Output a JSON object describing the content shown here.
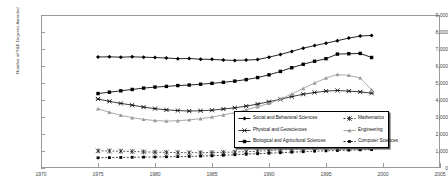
{
  "chart_data": {
    "type": "line",
    "title": "",
    "xlabel": "",
    "ylabel": "Number of S&E Degrees Awarded",
    "xlim": [
      1970,
      2005
    ],
    "ylim": [
      0,
      9000
    ],
    "xticks": [
      1970,
      1975,
      1980,
      1985,
      1990,
      1995,
      2000,
      2005
    ],
    "xtick_labels": [
      "1970",
      "1975",
      "1980",
      "1985",
      "1990",
      "1995",
      "2000",
      "2005"
    ],
    "yticks": [
      0,
      1000,
      2000,
      3000,
      4000,
      5000,
      6000,
      7000,
      8000,
      9000
    ],
    "ytick_labels": [
      "0",
      "1,000",
      "2,000",
      "3,000",
      "4,000",
      "5,000",
      "6,000",
      "7,000",
      "8,000",
      "9,000"
    ],
    "grid": false,
    "legend_position": "inside-lower-right",
    "x": [
      1975,
      1976,
      1977,
      1978,
      1979,
      1980,
      1981,
      1982,
      1983,
      1984,
      1985,
      1986,
      1987,
      1988,
      1989,
      1990,
      1991,
      1992,
      1993,
      1994,
      1995,
      1996,
      1997,
      1998,
      1999
    ],
    "series": [
      {
        "name": "Social and Behavioral Sciences",
        "marker": "diamond",
        "color": "#000000",
        "values": [
          6530,
          6540,
          6520,
          6540,
          6520,
          6500,
          6470,
          6430,
          6440,
          6400,
          6390,
          6350,
          6330,
          6350,
          6380,
          6520,
          6680,
          6860,
          7050,
          7200,
          7340,
          7490,
          7640,
          7760,
          7800
        ]
      },
      {
        "name": "Physical and Geosciences",
        "marker": "cross-x",
        "color": "#1a1a1a",
        "values": [
          4060,
          3920,
          3800,
          3700,
          3580,
          3490,
          3420,
          3380,
          3350,
          3370,
          3400,
          3470,
          3540,
          3640,
          3760,
          3900,
          4040,
          4200,
          4340,
          4440,
          4520,
          4560,
          4520,
          4480,
          4400
        ]
      },
      {
        "name": "Biological and Agricultural Sciences",
        "marker": "square",
        "color": "#000000",
        "values": [
          4380,
          4460,
          4540,
          4620,
          4700,
          4760,
          4800,
          4850,
          4880,
          4930,
          4980,
          5040,
          5110,
          5200,
          5320,
          5480,
          5680,
          5900,
          6100,
          6280,
          6430,
          6700,
          6720,
          6740,
          6500
        ]
      },
      {
        "name": "Mathematics",
        "marker": "star-x",
        "color": "#1a1a1a",
        "values": [
          1010,
          1000,
          990,
          970,
          950,
          930,
          920,
          910,
          900,
          900,
          910,
          920,
          940,
          960,
          990,
          1020,
          1060,
          1100,
          1140,
          1190,
          1220,
          1250,
          1260,
          1270,
          1230
        ]
      },
      {
        "name": "Engineering",
        "marker": "triangle",
        "color": "#9a9a9a",
        "values": [
          3480,
          3280,
          3100,
          2960,
          2860,
          2790,
          2760,
          2780,
          2830,
          2900,
          3000,
          3120,
          3260,
          3420,
          3600,
          3800,
          4050,
          4350,
          4680,
          5000,
          5290,
          5500,
          5450,
          5300,
          4600
        ]
      },
      {
        "name": "Computer Sciences",
        "marker": "square-small",
        "color": "#000000",
        "values": [
          600,
          610,
          620,
          630,
          640,
          650,
          660,
          670,
          680,
          700,
          720,
          750,
          780,
          810,
          840,
          870,
          900,
          930,
          960,
          990,
          1010,
          1030,
          1050,
          1070,
          1080
        ]
      }
    ]
  },
  "legend": {
    "entries": [
      {
        "label": "Social and Behavioral Sciences",
        "marker": "diamond",
        "color": "#000000"
      },
      {
        "label": "Mathematics",
        "marker": "star-x",
        "color": "#1a1a1a"
      },
      {
        "label": "Physical and Geosciences",
        "marker": "cross-x",
        "color": "#1a1a1a"
      },
      {
        "label": "Engineering",
        "marker": "triangle",
        "color": "#9a9a9a"
      },
      {
        "label": "Biological and Agricultural Sciences",
        "marker": "square",
        "color": "#000000"
      },
      {
        "label": "Computer Sciences",
        "marker": "square-small",
        "color": "#000000"
      }
    ]
  }
}
